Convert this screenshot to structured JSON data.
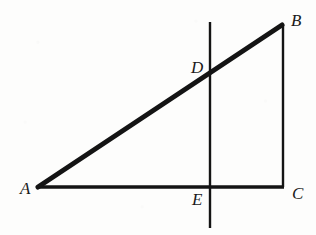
{
  "figure": {
    "background_color": "#fdfdfc",
    "stroke_color": "#141414",
    "width": 316,
    "height": 235,
    "points": {
      "A": {
        "label": "A",
        "x": 38,
        "y": 187,
        "label_x": 20,
        "label_y": 180
      },
      "B": {
        "label": "B",
        "x": 282,
        "y": 25,
        "label_x": 291,
        "label_y": 12
      },
      "C": {
        "label": "C",
        "x": 283,
        "y": 187,
        "label_x": 292,
        "label_y": 185
      },
      "D": {
        "label": "D",
        "x": 210,
        "y": 72,
        "label_x": 191,
        "label_y": 59
      },
      "E": {
        "label": "E",
        "x": 210,
        "y": 187,
        "label_x": 192,
        "label_y": 191
      }
    },
    "segments": [
      {
        "name": "hypotenuse-AB",
        "from": "A",
        "to": "B",
        "x1": 38,
        "y1": 187,
        "x2": 282,
        "y2": 25,
        "width": 5.0
      },
      {
        "name": "base-AC",
        "from": "A",
        "to": "C",
        "x1": 37,
        "y1": 187,
        "x2": 284,
        "y2": 187,
        "width": 3.6
      },
      {
        "name": "side-BC",
        "from": "B",
        "to": "C",
        "x1": 283,
        "y1": 25,
        "x2": 283,
        "y2": 187,
        "width": 2.4
      }
    ],
    "transversal": {
      "name": "vertical-line-DE",
      "x1": 210,
      "y1": 22,
      "x2": 210,
      "y2": 228,
      "width": 2.4
    }
  },
  "chart_data": {
    "type": "diagram",
    "shape": "right triangle",
    "vertices": [
      {
        "label": "A",
        "x": 38,
        "y": 187
      },
      {
        "label": "B",
        "x": 282,
        "y": 25
      },
      {
        "label": "C",
        "x": 283,
        "y": 187
      }
    ],
    "intersection_points": [
      {
        "label": "D",
        "x": 210,
        "y": 72,
        "on": "segment AB"
      },
      {
        "label": "E",
        "x": 210,
        "y": 187,
        "on": "segment AC"
      }
    ],
    "edges": [
      "AB",
      "AC",
      "BC"
    ],
    "extra_lines": [
      {
        "name": "DE",
        "type": "vertical",
        "x": 210,
        "from_y": 22,
        "to_y": 228
      }
    ],
    "right_angle_at": "C",
    "labels": [
      "A",
      "B",
      "C",
      "D",
      "E"
    ]
  }
}
